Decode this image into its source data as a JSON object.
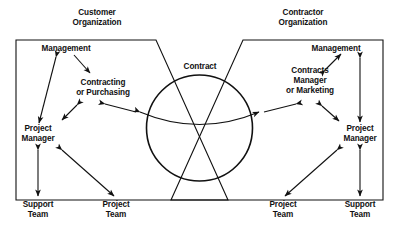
{
  "diagram": {
    "center": {
      "contract_label": "Contract"
    },
    "left_org": {
      "heading_line1": "Customer",
      "heading_line2": "Organization",
      "nodes": {
        "management": "Management",
        "contracting_line1": "Contracting",
        "contracting_line2": "or Purchasing",
        "project_manager_line1": "Project",
        "project_manager_line2": "Manager",
        "support_team_line1": "Support",
        "support_team_line2": "Team",
        "project_team_line1": "Project",
        "project_team_line2": "Team"
      }
    },
    "right_org": {
      "heading_line1": "Contractor",
      "heading_line2": "Organization",
      "nodes": {
        "management": "Management",
        "contracts_manager_line1": "Contracts",
        "contracts_manager_line2": "Manager",
        "contracts_manager_line3": "or Marketing",
        "project_manager_line1": "Project",
        "project_manager_line2": "Manager",
        "project_team_line1": "Project",
        "project_team_line2": "Team",
        "support_team_line1": "Support",
        "support_team_line2": "Team"
      }
    },
    "colors": {
      "stroke": "#111111",
      "background": "#ffffff",
      "text": "#111111"
    }
  }
}
